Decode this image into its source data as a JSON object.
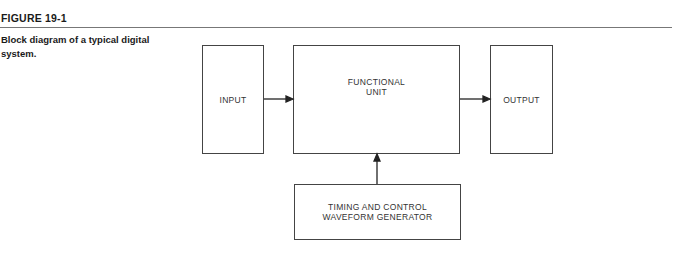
{
  "figure": {
    "label": "FIGURE 19-1",
    "caption": "Block diagram of a typical digital system."
  },
  "blocks": {
    "input": "INPUT",
    "functional_line1": "FUNCTIONAL",
    "functional_line2": "UNIT",
    "output": "OUTPUT",
    "timing_line1": "TIMING AND CONTROL",
    "timing_line2": "WAVEFORM GENERATOR"
  },
  "connections": [
    {
      "from": "INPUT",
      "to": "FUNCTIONAL UNIT"
    },
    {
      "from": "FUNCTIONAL UNIT",
      "to": "OUTPUT"
    },
    {
      "from": "TIMING AND CONTROL WAVEFORM GENERATOR",
      "to": "FUNCTIONAL UNIT"
    }
  ]
}
